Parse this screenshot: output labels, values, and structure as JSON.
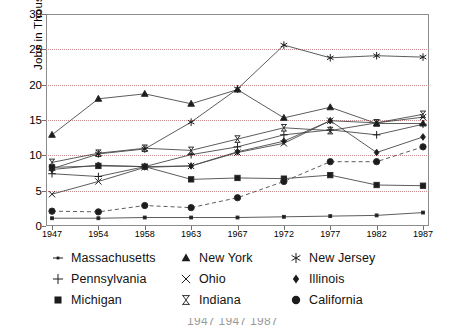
{
  "chart_data": {
    "type": "line",
    "title": "",
    "xlabel": "",
    "ylabel": "Jobs in Thousands",
    "categories": [
      "1947",
      "1954",
      "1958",
      "1963",
      "1967",
      "1972",
      "1977",
      "1982",
      "1987"
    ],
    "x": [
      1947,
      1954,
      1958,
      1963,
      1967,
      1972,
      1977,
      1982,
      1987
    ],
    "ylim": [
      0,
      30
    ],
    "yticks": [
      0,
      5,
      10,
      15,
      20,
      25,
      30
    ],
    "xlim": [
      1947,
      1987
    ],
    "grid": true,
    "grid_style": "dotted-horizontal",
    "legend_position": "below-plot",
    "series": [
      {
        "name": "Massachusetts",
        "marker": "small-dot",
        "line": "solid",
        "values": [
          1.1,
          1.1,
          1.2,
          1.2,
          1.2,
          1.3,
          1.4,
          1.5,
          1.9
        ]
      },
      {
        "name": "New York",
        "marker": "triangle-up",
        "line": "solid",
        "values": [
          12.9,
          18.0,
          18.7,
          17.3,
          19.3,
          15.3,
          16.8,
          14.5,
          14.5
        ]
      },
      {
        "name": "New Jersey",
        "marker": "asterisk",
        "line": "solid",
        "values": [
          8.1,
          10.2,
          10.9,
          14.7,
          19.4,
          25.6,
          23.8,
          24.1,
          23.9
        ]
      },
      {
        "name": "Pennsylvania",
        "marker": "plus",
        "line": "solid",
        "values": [
          7.4,
          7.0,
          8.4,
          10.1,
          11.2,
          12.9,
          13.6,
          12.9,
          14.4
        ]
      },
      {
        "name": "Ohio",
        "marker": "cross",
        "line": "solid",
        "values": [
          4.5,
          6.3,
          8.3,
          8.5,
          10.4,
          11.7,
          14.9,
          14.6,
          15.4
        ]
      },
      {
        "name": "Illinois",
        "marker": "diamond",
        "line": "solid",
        "values": [
          8.0,
          8.6,
          8.4,
          8.5,
          10.5,
          12.0,
          14.9,
          10.4,
          12.6
        ]
      },
      {
        "name": "Michigan",
        "marker": "square",
        "line": "solid",
        "values": [
          8.3,
          8.5,
          8.4,
          6.6,
          6.8,
          6.7,
          7.2,
          5.8,
          5.7
        ]
      },
      {
        "name": "Indiana",
        "marker": "hourglass",
        "line": "solid",
        "values": [
          9.0,
          10.3,
          11.0,
          10.7,
          12.3,
          13.9,
          13.5,
          14.6,
          15.8
        ]
      },
      {
        "name": "California",
        "marker": "filled-circle",
        "line": "dashed",
        "values": [
          2.1,
          2.0,
          2.9,
          2.6,
          4.0,
          6.3,
          9.1,
          9.1,
          11.2
        ]
      }
    ]
  },
  "axis": {
    "y_title": "Jobs in Thousands",
    "y_ticks": [
      "0",
      "5",
      "10",
      "15",
      "20",
      "25",
      "30"
    ],
    "x_ticks": [
      "1947",
      "1954",
      "1958",
      "1963",
      "1967",
      "1972",
      "1977",
      "1982",
      "1987"
    ]
  },
  "legend": {
    "entries": [
      {
        "label": "Massachusetts",
        "marker": "small-dot"
      },
      {
        "label": "New York",
        "marker": "triangle-up"
      },
      {
        "label": "New Jersey",
        "marker": "asterisk"
      },
      {
        "label": "Pennsylvania",
        "marker": "plus"
      },
      {
        "label": "Ohio",
        "marker": "cross"
      },
      {
        "label": "Illinois",
        "marker": "diamond"
      },
      {
        "label": "Michigan",
        "marker": "square"
      },
      {
        "label": "Indiana",
        "marker": "hourglass"
      },
      {
        "label": "California",
        "marker": "filled-circle"
      }
    ]
  },
  "caption": {
    "text": "1947 1947 1987"
  },
  "colors": {
    "line": "#4a4a4a",
    "marker": "#1c1c1c",
    "grid": "#c98b8b",
    "frame": "#8c8c8c",
    "text": "#111111"
  }
}
